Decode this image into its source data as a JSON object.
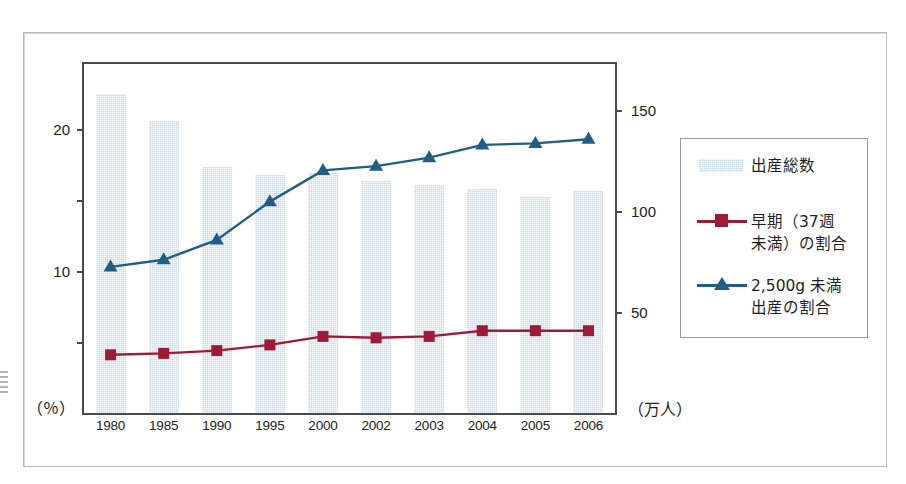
{
  "chart_data": {
    "type": "bar",
    "title": "",
    "categories": [
      "1980",
      "1985",
      "1990",
      "1995",
      "2000",
      "2002",
      "2003",
      "2004",
      "2005",
      "2006"
    ],
    "series": [
      {
        "name": "出産総数",
        "type": "bar",
        "axis": "right",
        "unit": "万人",
        "color": "#c8dcea",
        "values": [
          158,
          145,
          122,
          118,
          119,
          115,
          113,
          111,
          107,
          110
        ]
      },
      {
        "name": "早期（37週未満）の割合",
        "type": "line",
        "axis": "left",
        "unit": "%",
        "color": "#9e1b38",
        "marker": "square",
        "values": [
          4.1,
          4.2,
          4.4,
          4.8,
          5.4,
          5.3,
          5.4,
          5.8,
          5.8,
          5.8
        ]
      },
      {
        "name": "2,500g 未満出産の割合",
        "type": "line",
        "axis": "left",
        "unit": "%",
        "color": "#1f5f87",
        "marker": "triangle",
        "values": [
          10.3,
          10.8,
          12.2,
          14.9,
          17.1,
          17.4,
          18.0,
          18.9,
          19.0,
          19.3
        ]
      }
    ],
    "left_axis": {
      "label": "（％）",
      "ticks_labeled": [
        "20",
        "10"
      ],
      "tick_values": [
        20,
        15,
        10,
        5
      ],
      "ylim": [
        0,
        24.6
      ]
    },
    "right_axis": {
      "label": "（万人）",
      "ticks_labeled": [
        "150",
        "100",
        "50"
      ],
      "tick_values": [
        150,
        100,
        50
      ],
      "ylim": [
        0,
        173
      ]
    },
    "grid": false,
    "legend_position": "right-outside"
  },
  "axes": {
    "left": {
      "unit_caption": "（％）",
      "ticks": [
        {
          "value": 20,
          "label": "20"
        },
        {
          "value": 15,
          "label": ""
        },
        {
          "value": 10,
          "label": "10"
        },
        {
          "value": 5,
          "label": ""
        }
      ]
    },
    "right": {
      "unit_caption": "（万人）",
      "ticks": [
        {
          "value": 150,
          "label": "150"
        },
        {
          "value": 100,
          "label": "100"
        },
        {
          "value": 50,
          "label": "50"
        }
      ]
    },
    "x": {
      "labels": [
        "1980",
        "1985",
        "1990",
        "1995",
        "2000",
        "2002",
        "2003",
        "2004",
        "2005",
        "2006"
      ]
    }
  },
  "legend": {
    "items": [
      {
        "key": "bar-swatch",
        "label": "出産総数",
        "color": "#c8dcea"
      },
      {
        "key": "square-marker",
        "label": "早期（37週\n未満）の割合",
        "color": "#9e1b38"
      },
      {
        "key": "triangle-marker",
        "label": "2,500g 未満\n出産の割合",
        "color": "#1f5f87"
      }
    ]
  },
  "colors": {
    "bar": "#c8dcea",
    "line_red": "#9e1b38",
    "line_blue": "#1f5f87",
    "axis": "#4a4a4a",
    "frame": "#b9b9b9"
  }
}
